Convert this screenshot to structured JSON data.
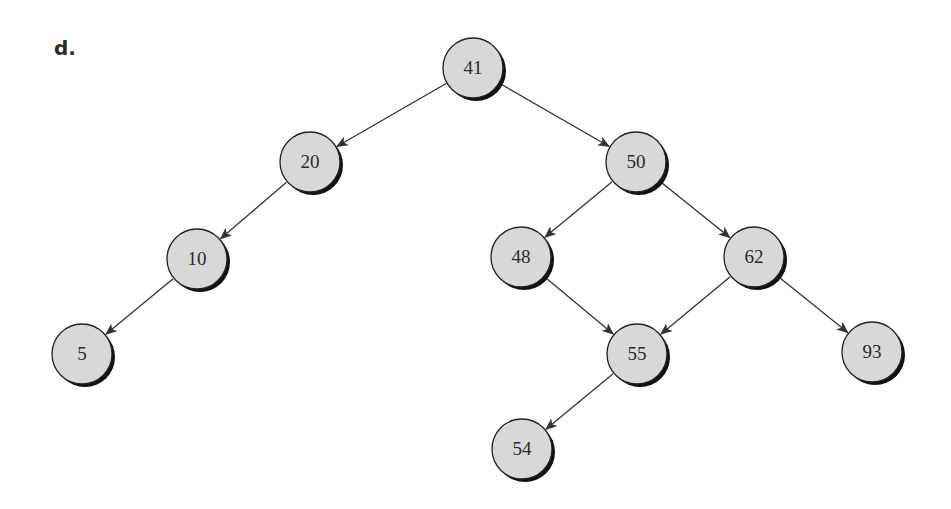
{
  "diagram": {
    "label": "d.",
    "type": "binary-search-tree",
    "node_radius": 30,
    "colors": {
      "fill": "#d8d8d8",
      "stroke": "#222222",
      "shadow": "#111111",
      "edge": "#333333"
    },
    "nodes": [
      {
        "id": "n41",
        "value": "41",
        "x": 473,
        "y": 68
      },
      {
        "id": "n20",
        "value": "20",
        "x": 310,
        "y": 162
      },
      {
        "id": "n50",
        "value": "50",
        "x": 636,
        "y": 162
      },
      {
        "id": "n10",
        "value": "10",
        "x": 197,
        "y": 259
      },
      {
        "id": "n48",
        "value": "48",
        "x": 521,
        "y": 257
      },
      {
        "id": "n62",
        "value": "62",
        "x": 754,
        "y": 257
      },
      {
        "id": "n5",
        "value": "5",
        "x": 82,
        "y": 354
      },
      {
        "id": "n55",
        "value": "55",
        "x": 637,
        "y": 354
      },
      {
        "id": "n93",
        "value": "93",
        "x": 872,
        "y": 352
      },
      {
        "id": "n54",
        "value": "54",
        "x": 522,
        "y": 449
      }
    ],
    "edges": [
      {
        "from": "n41",
        "to": "n20"
      },
      {
        "from": "n41",
        "to": "n50"
      },
      {
        "from": "n20",
        "to": "n10"
      },
      {
        "from": "n10",
        "to": "n5"
      },
      {
        "from": "n50",
        "to": "n48"
      },
      {
        "from": "n50",
        "to": "n62"
      },
      {
        "from": "n48",
        "to": "n55"
      },
      {
        "from": "n62",
        "to": "n55"
      },
      {
        "from": "n62",
        "to": "n93"
      },
      {
        "from": "n55",
        "to": "n54"
      }
    ]
  }
}
